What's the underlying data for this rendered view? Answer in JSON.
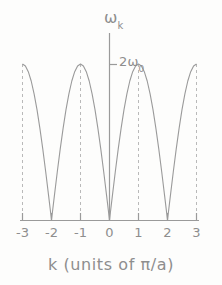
{
  "figure": {
    "background_color": "#fdfdfc",
    "line_color": "#9a9a9a",
    "text_color": "#8e8e8e"
  },
  "labels": {
    "ylabel_symbol": "ω",
    "ylabel_subscript": "k",
    "ylabel_full": "ωk",
    "ytick_label_prefix": "2ω",
    "ytick_label_subscript": "0",
    "ytick_label_full": "2ω₀",
    "xlabel": "k (units of π/a)"
  },
  "chart_data": {
    "type": "line",
    "title": "",
    "subtitle": "",
    "xlabel": "k (units of π/a)",
    "ylabel": "ωk",
    "xlim": [
      -3,
      3
    ],
    "ylim": [
      0,
      1
    ],
    "grid": false,
    "legend": null,
    "legend_position": "none",
    "xticks": [
      -3,
      -2,
      -1,
      0,
      1,
      2,
      3
    ],
    "xtick_labels": [
      "-3",
      "-2",
      "-1",
      "0",
      "1",
      "2",
      "3"
    ],
    "yticks": [
      1
    ],
    "ytick_labels": [
      "2ω₀"
    ],
    "annotations": [
      {
        "text": "2ω₀",
        "x": 0,
        "y": 1,
        "note": "maximum phonon frequency marked on vertical axis"
      }
    ],
    "dashed_vertical_lines": [
      -3,
      -1,
      1,
      3
    ],
    "curve_description": "omega_k = 2*omega_0 * |sin(k*pi/2)| : cusped zeros at even integers, maxima of 2omega_0 at odd integers",
    "series": [
      {
        "name": "ωk",
        "x": [
          -3,
          -2.9,
          -2.8,
          -2.7,
          -2.6,
          -2.5,
          -2.4,
          -2.3,
          -2.2,
          -2.1,
          -2,
          -1.9,
          -1.8,
          -1.7,
          -1.6,
          -1.5,
          -1.4,
          -1.3,
          -1.2,
          -1.1,
          -1,
          -0.9,
          -0.8,
          -0.7,
          -0.6,
          -0.5,
          -0.4,
          -0.3,
          -0.2,
          -0.1,
          0,
          0.1,
          0.2,
          0.3,
          0.4,
          0.5,
          0.6,
          0.7,
          0.8,
          0.9,
          1,
          1.1,
          1.2,
          1.3,
          1.4,
          1.5,
          1.6,
          1.7,
          1.8,
          1.9,
          2,
          2.1,
          2.2,
          2.3,
          2.4,
          2.5,
          2.6,
          2.7,
          2.8,
          2.9,
          3
        ],
        "values": [
          1,
          0.9877,
          0.9511,
          0.891,
          0.809,
          0.7071,
          0.5878,
          0.454,
          0.309,
          0.1564,
          0,
          0.1564,
          0.309,
          0.454,
          0.5878,
          0.7071,
          0.809,
          0.891,
          0.9511,
          0.9877,
          1,
          0.9877,
          0.9511,
          0.891,
          0.809,
          0.7071,
          0.5878,
          0.454,
          0.309,
          0.1564,
          0,
          0.1564,
          0.309,
          0.454,
          0.5878,
          0.7071,
          0.809,
          0.891,
          0.9511,
          0.9877,
          1,
          0.9877,
          0.9511,
          0.891,
          0.809,
          0.7071,
          0.5878,
          0.454,
          0.309,
          0.1564,
          0,
          0.1564,
          0.309,
          0.454,
          0.5878,
          0.7071,
          0.809,
          0.891,
          0.9511,
          0.9877,
          1
        ]
      }
    ]
  },
  "xtick_labels": [
    {
      "label": "-3"
    },
    {
      "label": "-2"
    },
    {
      "label": "-1"
    },
    {
      "label": "0"
    },
    {
      "label": "1"
    },
    {
      "label": "2"
    },
    {
      "label": "3"
    }
  ]
}
